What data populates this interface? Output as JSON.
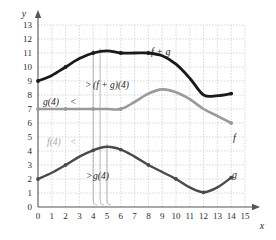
{
  "figure": {
    "axis_x_name": "x",
    "axis_y_name": "y"
  },
  "colors": {
    "curve_sum": "#1a1a1a",
    "curve_f": "#9a9a9a",
    "curve_g": "#4a4a4a",
    "grid": "#c9c9d6",
    "axis": "#555555",
    "background": "#ffffff",
    "annotation_gray": "#a8a8a8"
  },
  "labels": {
    "sum_curve": "f + g",
    "f_curve": "f",
    "g_curve": "g",
    "annot_sum_at_4": "(f + g)(4)",
    "annot_g_at_4_top": "g(4)",
    "annot_f_at_4": "f(4)",
    "annot_g_at_4_bottom": "g(4)"
  },
  "chart_data": {
    "type": "line",
    "title": "",
    "xlabel": "x",
    "ylabel": "y",
    "xlim": [
      0,
      15
    ],
    "ylim": [
      0,
      13
    ],
    "grid": true,
    "legend": "inline-curve-labels",
    "xticks": [
      0,
      1,
      2,
      3,
      4,
      5,
      6,
      7,
      8,
      9,
      10,
      11,
      12,
      13,
      14,
      15
    ],
    "yticks": [
      0,
      1,
      2,
      3,
      4,
      5,
      6,
      7,
      8,
      9,
      10,
      11,
      12,
      13
    ],
    "xtick_labels": [
      "0",
      "1",
      "2",
      "3",
      "4",
      "5",
      "6",
      "7",
      "8",
      "9",
      "10",
      "11",
      "12",
      "13",
      "14",
      "15"
    ],
    "ytick_labels": [
      "0",
      "1",
      "2",
      "3",
      "4",
      "5",
      "6",
      "7",
      "8",
      "9",
      "10",
      "11",
      "12",
      "13"
    ],
    "series": [
      {
        "name": "f + g",
        "color": "#1a1a1a",
        "x": [
          0,
          1,
          2,
          3,
          4,
          5,
          6,
          7,
          8,
          9,
          10,
          11,
          12,
          13,
          14
        ],
        "values": [
          9,
          9.4,
          10,
          10.6,
          11,
          11.15,
          11,
          11,
          11,
          10.8,
          10.2,
          9.2,
          8.0,
          7.95,
          8.1
        ],
        "markers_x": [
          0,
          2,
          4,
          6,
          8,
          14
        ],
        "markers_y": [
          9,
          10,
          11,
          11,
          11,
          8.1
        ]
      },
      {
        "name": "f",
        "color": "#9a9a9a",
        "x": [
          0,
          1,
          2,
          3,
          4,
          5,
          6,
          7,
          8,
          9,
          10,
          11,
          12,
          13,
          14
        ],
        "values": [
          7,
          7,
          7,
          7,
          7,
          7,
          7,
          7.5,
          8.1,
          8.4,
          8.2,
          7.7,
          7.0,
          6.5,
          6.0
        ],
        "markers_x": [
          0,
          2,
          4,
          6,
          14
        ],
        "markers_y": [
          7,
          7,
          7,
          7,
          6.0
        ]
      },
      {
        "name": "g",
        "color": "#4a4a4a",
        "x": [
          0,
          1,
          2,
          3,
          4,
          5,
          6,
          7,
          8,
          9,
          10,
          11,
          12,
          13,
          14
        ],
        "values": [
          2,
          2.45,
          3,
          3.6,
          4.05,
          4.3,
          4.1,
          3.6,
          3.0,
          2.5,
          2.0,
          1.4,
          1.05,
          1.4,
          2.1
        ],
        "markers_x": [
          0,
          2,
          4,
          6,
          8,
          10,
          12,
          14
        ],
        "markers_y": [
          2,
          3,
          4.05,
          4.1,
          3.0,
          2.0,
          1.05,
          2.1
        ]
      }
    ],
    "annotations": [
      {
        "text": "(f + g)(4)",
        "at_x": 4,
        "value": 11,
        "kind": "brace"
      },
      {
        "text": "g(4)",
        "at_x": 4,
        "value": 4.05,
        "kind": "brace"
      },
      {
        "text": "f(4)",
        "at_x": 4,
        "value": 7,
        "kind": "brace"
      },
      {
        "text": "g(4)",
        "at_x": 4,
        "value": 4.05,
        "kind": "brace"
      }
    ]
  }
}
